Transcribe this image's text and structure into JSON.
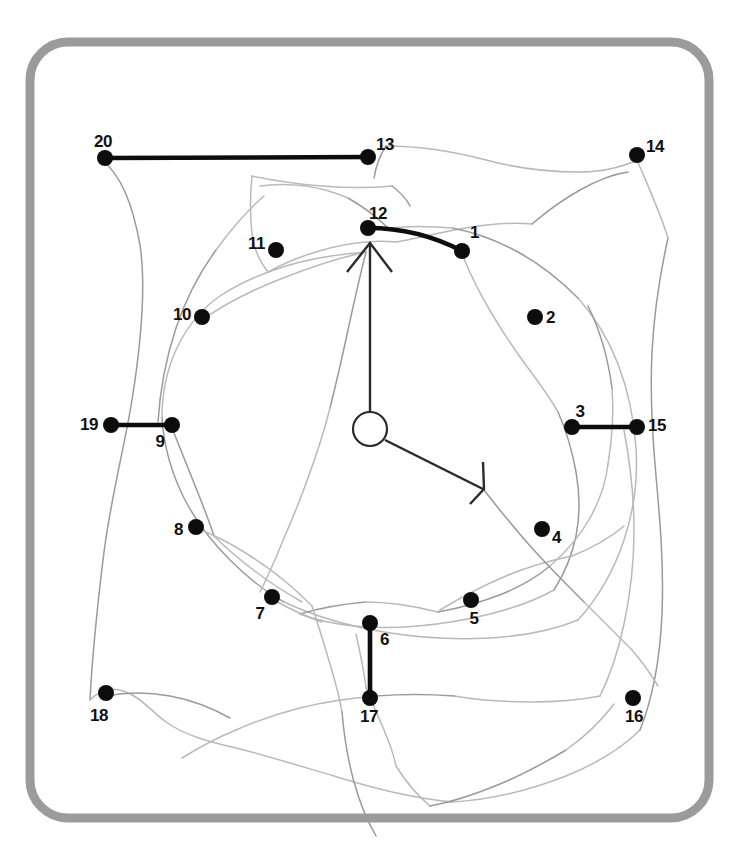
{
  "figure": {
    "canvas": {
      "width": 739,
      "height": 859,
      "background": "#ffffff"
    },
    "frame": {
      "name": "rounded-border-frame",
      "x": 30,
      "y": 42,
      "width": 679,
      "height": 776,
      "radius": 38,
      "stroke_color": "#9b9b9b",
      "stroke_width": 9
    },
    "colors": {
      "dot": "#0d0d0d",
      "label": "#111111",
      "bold_segment": "#0d0d0d",
      "hand": "#2b2b2e",
      "sketch_light": "#b9b9b9",
      "sketch_dark": "#9a9a9a",
      "frame": "#9b9b9b"
    },
    "clock_hub": {
      "name": "clock-center-hub",
      "cx": 370,
      "cy": 429,
      "r": 17
    },
    "hands": [
      {
        "name": "hour-hand-up",
        "label": "12",
        "from": [
          370,
          412
        ],
        "to": [
          370,
          243
        ],
        "arrowhead": [
          [
            347,
            272
          ],
          [
            370,
            243
          ],
          [
            392,
            272
          ]
        ]
      },
      {
        "name": "minute-hand-lower-right",
        "label": "4",
        "from": [
          385,
          440
        ],
        "to": [
          483,
          489
        ],
        "arrowhead": [
          [
            470,
            504
          ],
          [
            484,
            489
          ],
          [
            483,
            462
          ]
        ]
      }
    ],
    "points": [
      {
        "id": 1,
        "label": "1",
        "x": 462,
        "y": 251,
        "lx": 470,
        "ly": 238,
        "anchor": "start"
      },
      {
        "id": 2,
        "label": "2",
        "x": 535,
        "y": 317,
        "lx": 546,
        "ly": 323,
        "anchor": "start"
      },
      {
        "id": 3,
        "label": "3",
        "x": 572,
        "y": 427,
        "lx": 580,
        "ly": 417,
        "anchor": "middle"
      },
      {
        "id": 4,
        "label": "4",
        "x": 542,
        "y": 529,
        "lx": 552,
        "ly": 543,
        "anchor": "start"
      },
      {
        "id": 5,
        "label": "5",
        "x": 471,
        "y": 600,
        "lx": 474,
        "ly": 624,
        "anchor": "middle"
      },
      {
        "id": 6,
        "label": "6",
        "x": 370,
        "y": 623,
        "lx": 380,
        "ly": 645,
        "anchor": "start"
      },
      {
        "id": 7,
        "label": "7",
        "x": 272,
        "y": 597,
        "lx": 260,
        "ly": 619,
        "anchor": "middle"
      },
      {
        "id": 8,
        "label": "8",
        "x": 196,
        "y": 527,
        "lx": 183,
        "ly": 535,
        "anchor": "end"
      },
      {
        "id": 9,
        "label": "9",
        "x": 172,
        "y": 425,
        "lx": 160,
        "ly": 447,
        "anchor": "middle"
      },
      {
        "id": 10,
        "label": "10",
        "x": 202,
        "y": 317,
        "lx": 191,
        "ly": 320,
        "anchor": "end"
      },
      {
        "id": 11,
        "label": "11",
        "x": 276,
        "y": 250,
        "lx": 265,
        "ly": 249,
        "anchor": "end"
      },
      {
        "id": 12,
        "label": "12",
        "x": 368,
        "y": 228,
        "lx": 378,
        "ly": 219,
        "anchor": "middle"
      },
      {
        "id": 13,
        "label": "13",
        "x": 368,
        "y": 157,
        "lx": 376,
        "ly": 150,
        "anchor": "start"
      },
      {
        "id": 14,
        "label": "14",
        "x": 637,
        "y": 155,
        "lx": 646,
        "ly": 152,
        "anchor": "start"
      },
      {
        "id": 15,
        "label": "15",
        "x": 637,
        "y": 427,
        "lx": 648,
        "ly": 431,
        "anchor": "start"
      },
      {
        "id": 16,
        "label": "16",
        "x": 633,
        "y": 698,
        "lx": 634,
        "ly": 722,
        "anchor": "middle"
      },
      {
        "id": 17,
        "label": "17",
        "x": 370,
        "y": 698,
        "lx": 369,
        "ly": 722,
        "anchor": "middle"
      },
      {
        "id": 18,
        "label": "18",
        "x": 106,
        "y": 693,
        "lx": 99,
        "ly": 721,
        "anchor": "middle"
      },
      {
        "id": 19,
        "label": "19",
        "x": 111,
        "y": 425,
        "lx": 98,
        "ly": 430,
        "anchor": "end"
      },
      {
        "id": 20,
        "label": "20",
        "x": 105,
        "y": 158,
        "lx": 103,
        "ly": 147,
        "anchor": "middle"
      }
    ],
    "bold_segments": [
      {
        "name": "segment-20-13",
        "from": 20,
        "to": 13,
        "kind": "straight",
        "path": "M 105 158 L 368 157"
      },
      {
        "name": "segment-12-1",
        "from": 12,
        "to": 1,
        "kind": "arc",
        "path": "M 368 228 Q 418 228 462 251"
      },
      {
        "name": "segment-3-15",
        "from": 3,
        "to": 15,
        "kind": "straight",
        "path": "M 572 427 L 637 427"
      },
      {
        "name": "segment-19-9",
        "from": 19,
        "to": 9,
        "kind": "straight",
        "path": "M 111 425 L 172 425"
      },
      {
        "name": "segment-6-17",
        "from": 6,
        "to": 17,
        "kind": "straight",
        "path": "M 370 623 L 370 698"
      }
    ],
    "sketch_strokes": [
      "M 104 162 C 120 175 132 200 140 245 C 147 292 140 350 132 400 C 124 450 110 500 103 560 C 96 618 92 660 90 700",
      "M 90 700 C 100 690 112 686 126 692 C 142 698 152 712 166 722 C 186 736 210 742 236 748 C 268 756 300 766 334 776 C 372 788 410 798 452 802",
      "M 452 802 C 492 800 530 790 566 776 C 598 763 622 748 640 730",
      "M 640 730 C 652 700 660 660 662 614 C 664 566 660 520 656 476 C 652 432 650 392 652 352 C 654 312 660 274 668 238",
      "M 668 238 C 660 212 648 186 637 160",
      "M 637 160 C 620 168 600 172 578 172 C 548 172 516 168 486 160 C 452 151 418 146 386 146",
      "M 386 146 C 380 155 376 166 374 178",
      "M 252 176 C 250 196 250 216 252 234 C 254 250 260 262 268 272",
      "M 252 176 C 272 180 296 184 322 186 C 348 188 372 188 392 186",
      "M 392 186 C 400 192 406 198 410 206",
      "M 268 272 C 286 262 306 254 330 248 C 354 242 376 240 396 242",
      "M 396 242 C 418 238 442 232 466 228 C 490 224 512 222 532 224",
      "M 532 224 C 546 212 562 200 580 190 C 598 180 614 174 628 172",
      "M 202 320 C 222 306 248 292 278 280 C 308 268 338 258 366 252",
      "M 366 252 C 340 254 312 258 286 266 C 260 274 238 284 220 296 C 200 310 186 328 176 350 C 166 372 162 396 162 418",
      "M 162 418 C 164 448 172 474 184 498 C 196 522 212 542 230 560 C 248 578 266 592 284 602",
      "M 284 602 C 314 616 348 626 384 632 C 420 638 456 640 490 638 C 524 636 554 630 578 620",
      "M 578 620 C 598 598 614 570 624 540 C 634 510 638 478 636 448 C 634 418 628 390 618 364 C 608 338 594 316 578 298",
      "M 578 298 C 560 280 540 264 518 252 C 496 240 474 232 452 228",
      "M 452 228 C 430 226 408 226 388 228",
      "M 462 254 C 470 274 480 294 492 314 C 504 334 516 352 528 368 C 540 384 550 398 558 412",
      "M 558 412 C 566 430 572 450 576 472 C 580 494 580 516 576 536 C 572 556 564 574 554 590",
      "M 554 590 C 536 600 514 608 490 614 C 466 620 442 624 418 626",
      "M 418 626 C 396 628 374 628 354 626 C 334 624 316 620 300 614",
      "M 172 428 C 180 448 188 468 196 488 C 204 508 210 524 214 536",
      "M 214 536 C 226 548 240 560 256 572 C 272 584 288 594 302 602",
      "M 196 528 C 212 534 228 542 244 552 C 260 562 274 572 286 582 C 298 592 306 600 312 606",
      "M 158 422 C 160 390 166 358 176 328 C 186 298 200 272 216 250",
      "M 216 250 C 232 228 248 210 264 196",
      "M 356 634 C 360 652 364 670 366 688",
      "M 300 614 C 320 608 342 604 366 602",
      "M 274 600 C 288 608 304 616 322 622",
      "M 366 602 C 390 602 414 606 438 612",
      "M 438 612 C 460 608 482 602 502 594 C 522 586 538 576 550 566",
      "M 550 566 C 566 552 580 536 590 518 C 600 500 606 482 608 464",
      "M 608 464 C 612 440 614 414 612 388",
      "M 612 388 C 608 358 600 330 588 306",
      "M 624 430 C 630 462 634 496 634 530 C 634 564 630 596 624 624 C 618 652 610 676 600 696",
      "M 600 696 C 580 700 556 702 530 702 C 504 702 478 700 454 696",
      "M 454 696 C 428 694 402 694 376 696",
      "M 376 696 C 350 698 324 702 300 708 C 276 714 254 722 236 730",
      "M 236 730 C 216 738 198 748 182 758",
      "M 106 696 C 126 692 148 692 170 696 C 192 700 212 708 230 718",
      "M 366 688 C 372 702 378 716 384 730 C 390 744 394 756 396 766",
      "M 396 766 C 406 782 418 796 430 806",
      "M 430 806 C 452 802 476 794 500 784 C 524 774 546 762 566 750",
      "M 566 750 C 586 736 602 720 614 704",
      "M 312 606 C 318 624 324 644 330 664 C 336 684 340 700 342 712",
      "M 342 712 C 344 736 348 760 354 782 C 360 804 368 822 376 836",
      "M 440 610 C 460 598 482 586 506 576 C 530 566 552 560 572 556",
      "M 572 556 C 592 548 610 538 624 526",
      "M 484 490 C 498 508 514 528 532 548 C 550 568 568 586 584 602",
      "M 584 602 C 602 620 618 636 632 650",
      "M 632 650 C 644 664 652 676 658 686",
      "M 366 252 C 360 276 354 302 348 330 C 342 358 336 384 330 408",
      "M 330 408 C 324 432 316 456 308 478 C 300 500 292 520 284 538",
      "M 284 538 C 276 558 268 576 260 592",
      "M 388 228 C 376 216 362 206 348 198",
      "M 348 198 C 334 192 320 188 306 186",
      "M 306 186 C 290 184 274 184 260 186"
    ]
  }
}
